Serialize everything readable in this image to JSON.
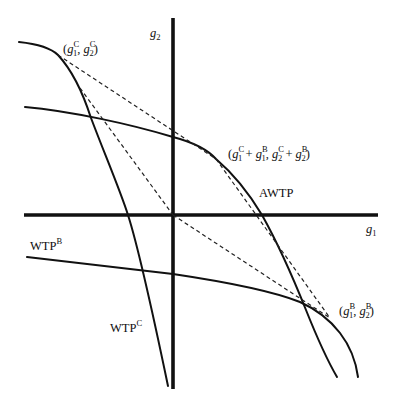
{
  "figure": {
    "axes": {
      "x_label": "g",
      "x_label_sub": "1",
      "y_label": "g",
      "y_label_sub": "2"
    },
    "curves": [
      {
        "id": "wtp-c",
        "label": "WTP",
        "label_sup": "C"
      },
      {
        "id": "wtp-b",
        "label": "WTP",
        "label_sup": "B"
      },
      {
        "id": "awtp",
        "label": "AWTP"
      }
    ],
    "points": {
      "p_c": {
        "open": "(",
        "g": "g",
        "s1": "1",
        "sup_c": "C",
        "comma": ", ",
        "s2": "2",
        "close": ")"
      },
      "p_b": {
        "open": "(",
        "g": "g",
        "s1": "1",
        "sup_b": "B",
        "comma": ", ",
        "s2": "2",
        "close": ")"
      },
      "p_sum": {
        "open": "(",
        "g": "g",
        "s1": "1",
        "s2": "2",
        "sup_c": "C",
        "sup_b": "B",
        "plus": " + ",
        "comma": ", ",
        "close": ")"
      }
    },
    "colors": {
      "line": "#111111",
      "background": "#ffffff"
    }
  }
}
